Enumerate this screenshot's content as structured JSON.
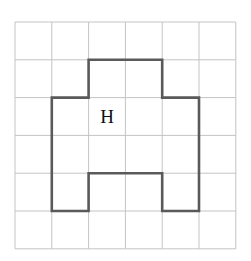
{
  "grid": {
    "cols": 6,
    "rows": 6,
    "origin_x": 15,
    "origin_y": 22,
    "cell_w": 36.8,
    "cell_h": 37.8,
    "line_color": "#c4c4c4"
  },
  "shape": {
    "stroke_color": "#5a5a5a",
    "vertices": [
      [
        2,
        1
      ],
      [
        4,
        1
      ],
      [
        4,
        2
      ],
      [
        5,
        2
      ],
      [
        5,
        5
      ],
      [
        4,
        5
      ],
      [
        4,
        4
      ],
      [
        2,
        4
      ],
      [
        2,
        5
      ],
      [
        1,
        5
      ],
      [
        1,
        2
      ],
      [
        2,
        2
      ]
    ]
  },
  "label": {
    "text": "H",
    "col": 2,
    "row": 2
  }
}
